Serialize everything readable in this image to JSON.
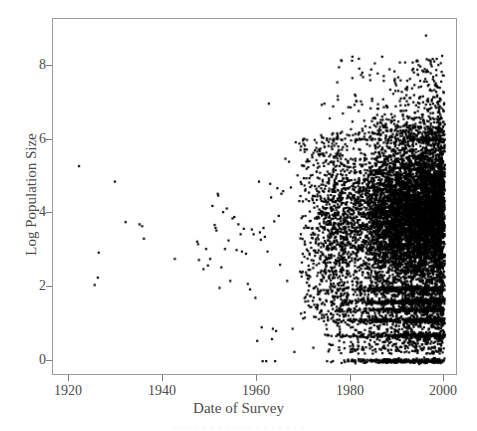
{
  "figure": {
    "background_color": "#ffffff",
    "frame_color": "#9b9b9b",
    "point_color": "#000000"
  },
  "chart_data": {
    "type": "scatter",
    "title": "",
    "xlabel": "Date of Survey",
    "ylabel": "Log Population Size",
    "xlim": [
      1914,
      2004
    ],
    "ylim": [
      -0.35,
      9.3
    ],
    "xticks": [
      1920,
      1940,
      1960,
      1980,
      2000
    ],
    "xticklabels": [
      "1920",
      "1940",
      "1960",
      "1980",
      "2000"
    ],
    "yticks": [
      0,
      2,
      4,
      6,
      8
    ],
    "yticklabels": [
      "0",
      "2",
      "4",
      "6",
      "8"
    ],
    "grid": false,
    "legend": null,
    "marker": "filled-square",
    "marker_size_px": 2.2,
    "approx_point_count": 6800,
    "sparse_points": [
      [
        1919.8,
        5.3
      ],
      [
        1923.3,
        2.07
      ],
      [
        1924.0,
        2.27
      ],
      [
        1924.2,
        2.95
      ],
      [
        1927.8,
        4.88
      ],
      [
        1930.2,
        3.78
      ],
      [
        1933.3,
        3.72
      ],
      [
        1933.9,
        3.67
      ],
      [
        1934.3,
        3.33
      ],
      [
        1941.2,
        2.78
      ],
      [
        1946.2,
        3.25
      ],
      [
        1946.4,
        3.18
      ],
      [
        1946.6,
        2.75
      ],
      [
        1947.6,
        2.5
      ],
      [
        1948.2,
        3.05
      ],
      [
        1948.6,
        2.6
      ],
      [
        1949.1,
        2.78
      ],
      [
        1949.6,
        4.22
      ],
      [
        1950.1,
        3.7
      ],
      [
        1950.3,
        3.62
      ],
      [
        1950.5,
        3.55
      ],
      [
        1950.8,
        4.55
      ],
      [
        1950.9,
        4.5
      ],
      [
        1951.2,
        1.99
      ],
      [
        1951.6,
        2.55
      ],
      [
        1952.0,
        4.05
      ],
      [
        1952.4,
        3.05
      ],
      [
        1952.8,
        4.15
      ],
      [
        1953.2,
        3.28
      ],
      [
        1953.6,
        2.18
      ],
      [
        1954.1,
        3.88
      ],
      [
        1954.5,
        3.92
      ],
      [
        1955.0,
        3.02
      ],
      [
        1955.4,
        3.72
      ],
      [
        1955.9,
        3.45
      ],
      [
        1956.2,
        2.98
      ],
      [
        1956.6,
        3.6
      ],
      [
        1957.1,
        2.92
      ],
      [
        1957.5,
        2.1
      ],
      [
        1958.0,
        1.95
      ],
      [
        1958.4,
        3.58
      ],
      [
        1958.8,
        3.45
      ],
      [
        1959.2,
        1.72
      ],
      [
        1959.6,
        0.55
      ],
      [
        1960.0,
        4.88
      ],
      [
        1960.2,
        3.5
      ],
      [
        1960.4,
        3.3
      ],
      [
        1960.6,
        0.92
      ],
      [
        1960.8,
        0.0
      ],
      [
        1961.0,
        3.62
      ],
      [
        1961.3,
        3.38
      ],
      [
        1961.6,
        0.0
      ],
      [
        1961.9,
        2.98
      ],
      [
        1962.2,
        7.0
      ],
      [
        1962.5,
        4.82
      ],
      [
        1962.7,
        4.45
      ],
      [
        1962.9,
        0.6
      ],
      [
        1963.1,
        0.88
      ],
      [
        1963.4,
        3.8
      ],
      [
        1963.6,
        0.0
      ],
      [
        1963.8,
        0.82
      ],
      [
        1964.1,
        4.7
      ],
      [
        1964.4,
        3.95
      ],
      [
        1964.7,
        2.62
      ],
      [
        1965.0,
        4.55
      ],
      [
        1965.4,
        4.62
      ],
      [
        1965.9,
        5.5
      ],
      [
        1966.3,
        2.18
      ],
      [
        1966.7,
        5.42
      ],
      [
        1967.1,
        4.72
      ],
      [
        1967.5,
        0.88
      ],
      [
        1967.9,
        0.25
      ],
      [
        1968.2,
        5.95
      ],
      [
        1968.6,
        5.05
      ],
      [
        1969.0,
        4.35
      ],
      [
        1974.6,
        7.0
      ],
      [
        1975.2,
        0.0
      ]
    ],
    "dense_region": {
      "x_start": 1969,
      "x_end": 2001.5,
      "core_y_low": 2.0,
      "core_y_high": 6.0,
      "tail_y_low": -0.05,
      "tail_y_high": 8.4,
      "peak_density_x": 1993,
      "band_levels": [
        0.0,
        0.69,
        1.1,
        1.39,
        1.61,
        1.95
      ]
    },
    "top_outlier": {
      "x": 1997.3,
      "y": 8.85
    },
    "high_outliers": [
      [
        1982.3,
        8.22
      ],
      [
        1995.2,
        8.15
      ],
      [
        2000.6,
        8.1
      ],
      [
        1982.8,
        7.78
      ],
      [
        1986.5,
        7.82
      ],
      [
        1996.0,
        7.62
      ],
      [
        1999.5,
        7.55
      ]
    ]
  },
  "caption": {
    "sliver_text": "· · · · · · · · · · · · · · · · · ·"
  }
}
